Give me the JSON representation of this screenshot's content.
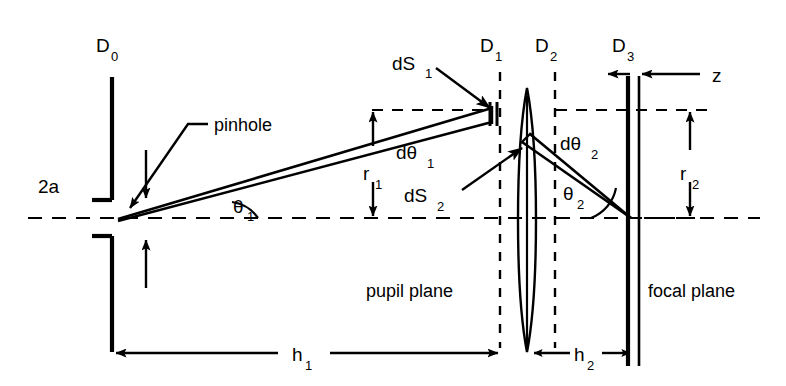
{
  "figure": {
    "background_color": "#ffffff",
    "ink_color": "#000000",
    "width": 786,
    "height": 386
  },
  "labels": {
    "d0": "D",
    "d0_sub": "0",
    "d1": "D",
    "d1_sub": "1",
    "d2": "D",
    "d2_sub": "2",
    "d3": "D",
    "d3_sub": "3",
    "pinhole": "pinhole",
    "aperture": "2a",
    "theta1": "θ",
    "theta1_sub": "1",
    "theta2": "θ",
    "theta2_sub": "2",
    "dtheta1": "dθ",
    "dtheta1_sub": "1",
    "dtheta2": "dθ",
    "dtheta2_sub": "2",
    "ds1": "dS",
    "ds1_sub": "1",
    "ds2": "dS",
    "ds2_sub": "2",
    "r1": "r",
    "r1_sub": "1",
    "r2": "r",
    "r2_sub": "2",
    "h1": "h",
    "h1_sub": "1",
    "h2": "h",
    "h2_sub": "2",
    "z": "z",
    "pupil_plane": "pupil plane",
    "focal_plane": "focal plane"
  }
}
